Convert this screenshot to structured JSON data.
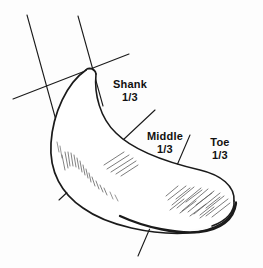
{
  "figure": {
    "background_color": "#fdfdfd",
    "ink_color": "#1a1a1a",
    "hatch_color": "#555555"
  },
  "labels": [
    {
      "id": "shank",
      "name": "Shank",
      "fraction": "1/3"
    },
    {
      "id": "middle",
      "name": "Middle",
      "fraction": "1/3"
    },
    {
      "id": "toe",
      "name": "Toe",
      "fraction": "1/3"
    }
  ],
  "sections": {
    "count": 3,
    "each_fraction": "1/3"
  }
}
